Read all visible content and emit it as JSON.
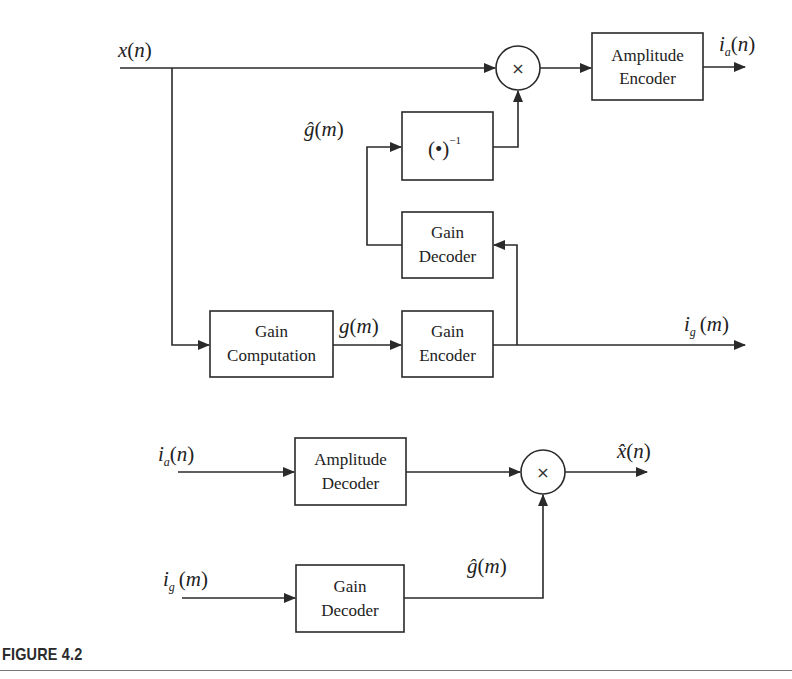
{
  "encoder": {
    "input_signal": {
      "base": "x",
      "arg": "n",
      "hat": false
    },
    "blocks": {
      "amplitude_encoder": [
        "Amplitude",
        "Encoder"
      ],
      "inverse": {
        "base": "(•)",
        "exp": "−1"
      },
      "gain_decoder": [
        "Gain",
        "Decoder"
      ],
      "gain_computation": [
        "Gain",
        "Computation"
      ],
      "gain_encoder": [
        "Gain",
        "Encoder"
      ],
      "multiplier": "×"
    },
    "labels": {
      "ia_out": {
        "base": "i",
        "sub": "a",
        "arg": "n"
      },
      "ghat": {
        "base": "ĝ",
        "arg": "m"
      },
      "g": {
        "base": "g",
        "arg": "m"
      },
      "ig_out": {
        "base": "i",
        "sub": "g",
        "arg": "m"
      }
    }
  },
  "decoder": {
    "blocks": {
      "amplitude_decoder": [
        "Amplitude",
        "Decoder"
      ],
      "gain_decoder": [
        "Gain",
        "Decoder"
      ],
      "multiplier": "×"
    },
    "labels": {
      "ia_in": {
        "base": "i",
        "sub": "a",
        "arg": "n"
      },
      "ig_in": {
        "base": "i",
        "sub": "g",
        "arg": "m"
      },
      "ghat": {
        "base": "ĝ",
        "arg": "m"
      },
      "xhat_out": {
        "base": "x̂",
        "arg": "n"
      }
    }
  },
  "caption": {
    "title": "FIGURE 4.2"
  },
  "colors": {
    "line": "#2a2a2a",
    "text": "#222222",
    "background": "#ffffff",
    "rule": "#777777"
  }
}
